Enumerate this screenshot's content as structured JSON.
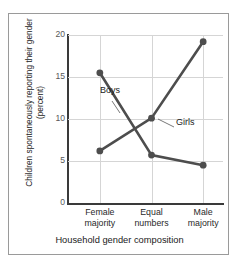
{
  "top_cut_text": "",
  "axes": {
    "y_title": "Children spontaneously reporting their gender\n(percent)",
    "x_title": "Household gender composition",
    "y_ticks": [
      "0",
      "5",
      "10",
      "15",
      "20"
    ],
    "x_ticks": [
      "Female\nmajority",
      "Equal\nnumbers",
      "Male\nmajority"
    ]
  },
  "annotations": {
    "boys": "Boys",
    "girls": "Girls"
  },
  "colors": {
    "series": "#4d4d4d",
    "grid": "#d5d5d5",
    "axis": "#3a3a3a",
    "frame": "#9a9a9a",
    "text": "#1a1a1a"
  },
  "chart_data": {
    "type": "line",
    "title": "",
    "xlabel": "Household gender composition",
    "ylabel": "Children spontaneously reporting their gender (percent)",
    "categories": [
      "Female majority",
      "Equal numbers",
      "Male majority"
    ],
    "ylim": [
      0,
      20
    ],
    "yticks": [
      0,
      5,
      10,
      15,
      20
    ],
    "grid": true,
    "legend_position": "inline-annotation",
    "series": [
      {
        "name": "Boys",
        "values": [
          15.5,
          5.7,
          4.5
        ],
        "color": "#4d4d4d",
        "marker": "circle"
      },
      {
        "name": "Girls",
        "values": [
          6.2,
          10.1,
          19.2
        ],
        "color": "#4d4d4d",
        "marker": "circle"
      }
    ]
  }
}
